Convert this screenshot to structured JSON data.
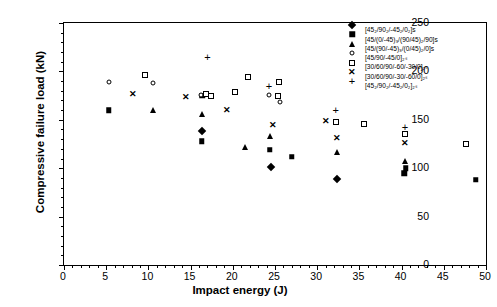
{
  "chart_data": {
    "type": "scatter",
    "title": "",
    "xlabel": "Impact energy (J)",
    "ylabel": "Compressive failure load (kN)",
    "xlim": [
      0,
      50
    ],
    "ylim": [
      0,
      250
    ],
    "xticks": [
      0,
      5,
      10,
      15,
      20,
      25,
      30,
      35,
      40,
      45,
      50
    ],
    "yticks": [
      0,
      50,
      100,
      150,
      200,
      250
    ],
    "x_minor_tick_step": 1,
    "y_minor_tick_step": 10,
    "grid": false,
    "legend_position": "top-right",
    "series": [
      {
        "name": "[45₂/90₂/-45₂/0₂]s",
        "marker": "filled-diamond",
        "color": "#000000",
        "points": [
          {
            "x": 16.3,
            "y": 138
          },
          {
            "x": 24.5,
            "y": 101
          },
          {
            "x": 32.3,
            "y": 89
          }
        ]
      },
      {
        "name": "[45/(0/-45)₃/(90/45)₂/90]s",
        "marker": "filled-square",
        "color": "#000000",
        "points": [
          {
            "x": 5.3,
            "y": 160
          },
          {
            "x": 16.3,
            "y": 128
          },
          {
            "x": 16.4,
            "y": 175
          },
          {
            "x": 24.4,
            "y": 119
          },
          {
            "x": 27.0,
            "y": 112
          },
          {
            "x": 40.3,
            "y": 95
          },
          {
            "x": 40.5,
            "y": 100
          },
          {
            "x": 48.8,
            "y": 88
          }
        ]
      },
      {
        "name": "[45/(90/-45)₃/(0/45)₂/0]s",
        "marker": "filled-triangle",
        "color": "#000000",
        "points": [
          {
            "x": 10.6,
            "y": 160
          },
          {
            "x": 16.3,
            "y": 156
          },
          {
            "x": 21.4,
            "y": 122
          },
          {
            "x": 24.4,
            "y": 133
          },
          {
            "x": 32.3,
            "y": 117
          },
          {
            "x": 40.4,
            "y": 107
          }
        ]
      },
      {
        "name": "[45/90/-45/0]₂ₛ",
        "marker": "open-circle",
        "color": "#000000",
        "points": [
          {
            "x": 5.3,
            "y": 189
          },
          {
            "x": 10.5,
            "y": 188
          },
          {
            "x": 16.2,
            "y": 176
          },
          {
            "x": 24.3,
            "y": 176
          },
          {
            "x": 25.6,
            "y": 168
          }
        ]
      },
      {
        "name": "[30/60/90/-60/-30/0]₂ₛ",
        "marker": "open-square",
        "color": "#000000",
        "points": [
          {
            "x": 9.6,
            "y": 196
          },
          {
            "x": 16.8,
            "y": 177
          },
          {
            "x": 17.4,
            "y": 175
          },
          {
            "x": 20.3,
            "y": 179
          },
          {
            "x": 21.8,
            "y": 194
          },
          {
            "x": 25.4,
            "y": 175
          },
          {
            "x": 25.5,
            "y": 189
          },
          {
            "x": 32.2,
            "y": 148
          },
          {
            "x": 35.6,
            "y": 146
          },
          {
            "x": 40.4,
            "y": 135
          },
          {
            "x": 47.6,
            "y": 125
          }
        ]
      },
      {
        "name": "[30/60/90/-30/-60/0]₂ₛ",
        "marker": "cross-x",
        "color": "#000000",
        "points": [
          {
            "x": 8.2,
            "y": 177
          },
          {
            "x": 14.4,
            "y": 174
          },
          {
            "x": 19.3,
            "y": 160
          },
          {
            "x": 24.8,
            "y": 145
          },
          {
            "x": 31.1,
            "y": 149
          },
          {
            "x": 32.3,
            "y": 131
          },
          {
            "x": 40.4,
            "y": 126
          }
        ]
      },
      {
        "name": "[45₂/90₂/-45₂/0₂]₂ₛ",
        "marker": "plus",
        "color": "#000000",
        "points": [
          {
            "x": 17.0,
            "y": 215
          },
          {
            "x": 24.3,
            "y": 185
          },
          {
            "x": 32.2,
            "y": 160
          },
          {
            "x": 40.4,
            "y": 143
          }
        ]
      }
    ]
  }
}
